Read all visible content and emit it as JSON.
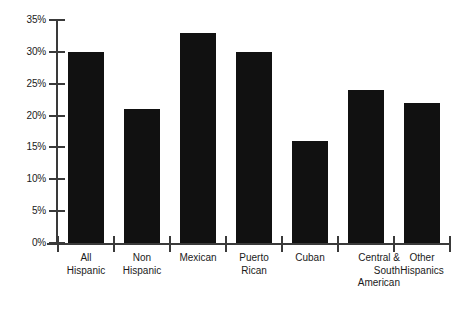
{
  "chart_data": {
    "type": "bar",
    "title": "",
    "subtitle": "",
    "xlabel": "",
    "ylabel": "",
    "categories": [
      "All Hispanic",
      "Non Hispanic",
      "Mexican",
      "Puerto Rican",
      "Cuban",
      "Central & South American",
      "Other Hispanics"
    ],
    "category_lines": [
      [
        "All",
        "Hispanic"
      ],
      [
        "Non",
        "Hispanic"
      ],
      [
        "Mexican"
      ],
      [
        "Puerto",
        "Rican"
      ],
      [
        "Cuban"
      ],
      [
        "Central &",
        "South",
        "American"
      ],
      [
        "Other",
        "Hispanics"
      ]
    ],
    "values": [
      30,
      21,
      33,
      30,
      16,
      24,
      22
    ],
    "value_labels": [
      "30%",
      "21%",
      "33%",
      "30%",
      "16%",
      "24%",
      "22%"
    ],
    "ylim": [
      0,
      35
    ],
    "ytick_values": [
      0,
      5,
      10,
      15,
      20,
      25,
      30,
      35
    ],
    "ytick_labels": [
      "0%",
      "5%",
      "10%",
      "15%",
      "20%",
      "25%",
      "30%",
      "35%"
    ],
    "grid": false,
    "legend": null,
    "legend_position": "none",
    "bar_color": "#111111",
    "axis_color": "#3a3a3a",
    "background_color": "#ffffff"
  }
}
